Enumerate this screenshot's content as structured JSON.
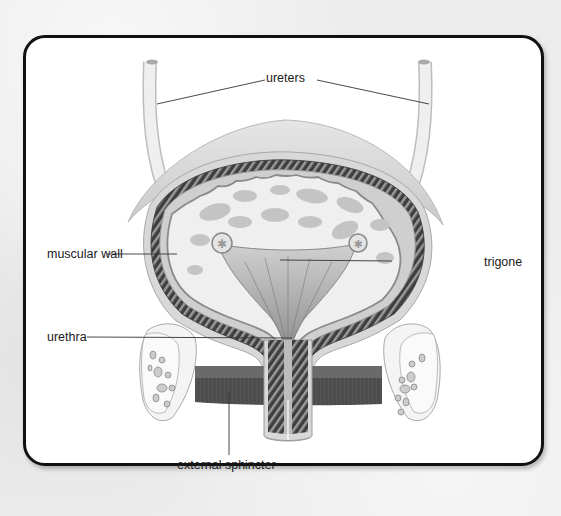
{
  "diagram": {
    "labels": {
      "ureters": "ureters",
      "muscular_wall": "muscular wall",
      "trigone": "trigone",
      "urethra": "urethra",
      "external_sphincter": "external sphincter"
    },
    "colors": {
      "frame": "#111111",
      "card": "#ffffff",
      "background": "#ececec",
      "tissue_light": "#dcdcdc",
      "tissue_mid": "#bdbdbd",
      "muscle_dark": "#4a4a4a",
      "sphincter": "#4d4d4d",
      "leader_line": "#333333"
    }
  }
}
